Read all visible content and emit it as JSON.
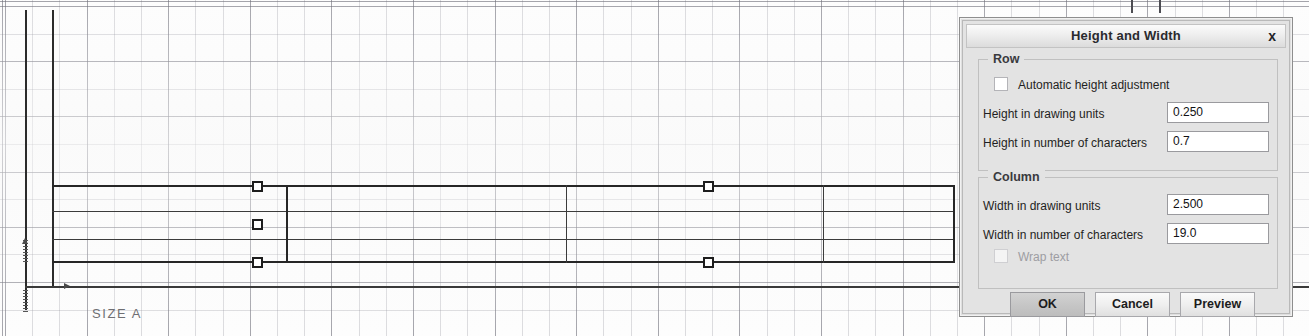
{
  "canvas": {
    "sheet_label": "SIZE  A",
    "grips": [
      {
        "x": 252,
        "y": 181,
        "name": "row-grip-top"
      },
      {
        "x": 252,
        "y": 219,
        "name": "row-grip-middle"
      },
      {
        "x": 252,
        "y": 257,
        "name": "row-grip-bottom"
      },
      {
        "x": 703,
        "y": 181,
        "name": "column-grip-top"
      },
      {
        "x": 703,
        "y": 257,
        "name": "column-grip-bottom"
      }
    ]
  },
  "dialog": {
    "title": "Height and Width",
    "close_label": "x",
    "row_group": {
      "legend": "Row",
      "auto_height_label": "Automatic height adjustment",
      "auto_height_checked": false,
      "height_units_label": "Height in drawing units",
      "height_units_value": "0.250",
      "height_chars_label": "Height in number of characters",
      "height_chars_value": "0.7"
    },
    "column_group": {
      "legend": "Column",
      "width_units_label": "Width in drawing units",
      "width_units_value": "2.500",
      "width_chars_label": "Width in number of characters",
      "width_chars_value": "19.0",
      "wrap_text_label": "Wrap text",
      "wrap_text_checked": false,
      "wrap_text_disabled": true
    },
    "buttons": {
      "ok": "OK",
      "cancel": "Cancel",
      "preview": "Preview"
    }
  },
  "colors": {
    "dialog_face": "#e3e3e3",
    "field_bg": "#ffffff",
    "text": "#1f1f22",
    "disabled_text": "#9d9da2",
    "line": "#262626"
  }
}
